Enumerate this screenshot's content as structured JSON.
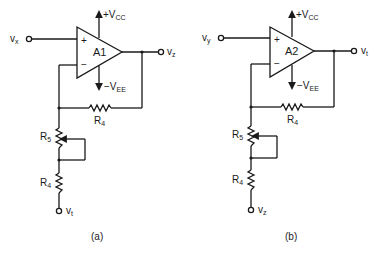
{
  "figure": {
    "panels": [
      {
        "caption": "(a)",
        "opamp": {
          "name": "A1",
          "plus": "+",
          "minus": "−"
        },
        "supply_pos": {
          "prefix": "+V",
          "sub": "CC"
        },
        "supply_neg": {
          "prefix": "−V",
          "sub": "EE"
        },
        "input": {
          "v": "v",
          "sub": "x"
        },
        "output": {
          "v": "v",
          "sub": "z"
        },
        "feedback_resistor": {
          "r": "R",
          "sub": "4"
        },
        "pot_resistor": {
          "r": "R",
          "sub": "5"
        },
        "ground_resistor": {
          "r": "R",
          "sub": "4"
        },
        "bottom_terminal": {
          "v": "v",
          "sub": "t"
        }
      },
      {
        "caption": "(b)",
        "opamp": {
          "name": "A2",
          "plus": "+",
          "minus": "−"
        },
        "supply_pos": {
          "prefix": "+V",
          "sub": "CC"
        },
        "supply_neg": {
          "prefix": "−V",
          "sub": "EE"
        },
        "input": {
          "v": "v",
          "sub": "y"
        },
        "output": {
          "v": "v",
          "sub": "t"
        },
        "feedback_resistor": {
          "r": "R",
          "sub": "4"
        },
        "pot_resistor": {
          "r": "R",
          "sub": "5"
        },
        "ground_resistor": {
          "r": "R",
          "sub": "4"
        },
        "bottom_terminal": {
          "v": "v",
          "sub": "z"
        }
      }
    ]
  }
}
